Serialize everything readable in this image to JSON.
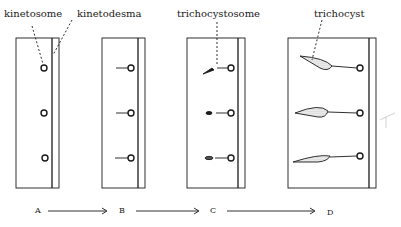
{
  "labels": {
    "kinetosome": "kinetosome",
    "kinetodesma": "kinetodesma",
    "trichocystosome": "trichocystosome",
    "trichocyst": "trichocyst"
  },
  "stages": [
    "A",
    "B",
    "C",
    "D"
  ],
  "colors": {
    "ink": "#1a1a1a",
    "background": "#ffffff",
    "stipple": "#9a9a9a"
  }
}
